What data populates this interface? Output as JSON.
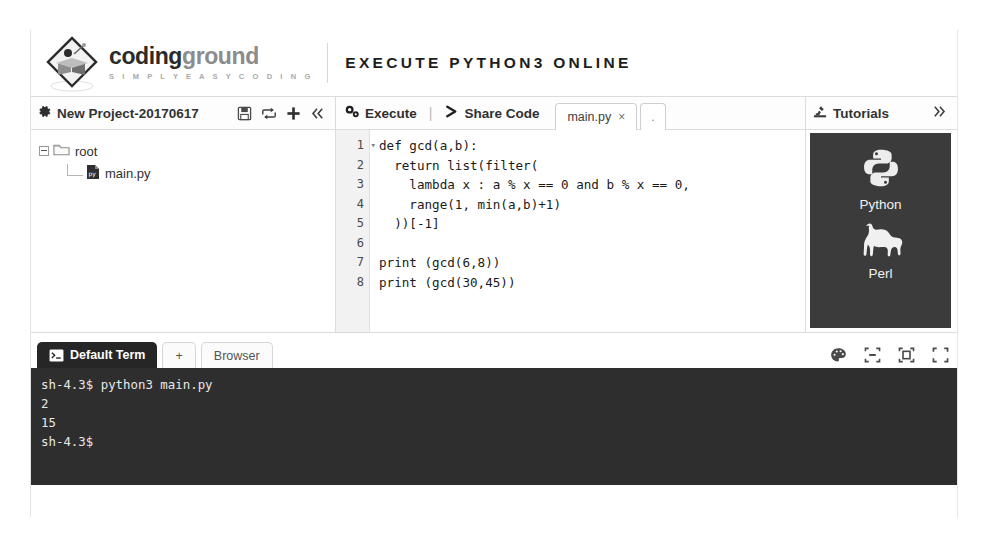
{
  "header": {
    "logo_icon": "codingground-diamond-book-logo",
    "brand_part1": "coding",
    "brand_part2": "ground",
    "brand_tagline": "S I M P L Y E A S Y C O D I N G",
    "page_title": "EXECUTE PYTHON3 ONLINE"
  },
  "project_panel": {
    "gear_icon": "gear-icon",
    "title": "New Project-20170617",
    "icons": [
      {
        "name": "save-icon",
        "glyph": "save"
      },
      {
        "name": "share-project-icon",
        "glyph": "share"
      },
      {
        "name": "add-file-icon",
        "glyph": "plus"
      },
      {
        "name": "collapse-icon",
        "glyph": "«"
      }
    ],
    "tree": {
      "root_label": "root",
      "root_icon": "folder-icon",
      "file_label": "main.py",
      "file_icon": "python-file-icon"
    }
  },
  "editor_panel": {
    "execute_label": "Execute",
    "execute_icon": "gear-icon",
    "separator": "|",
    "share_label": "Share Code",
    "share_icon": "chevron-right-icon",
    "tabs": [
      {
        "label": "main.py",
        "close": "×",
        "active": true
      },
      {
        "label": ".",
        "active": false
      }
    ],
    "line_numbers": [
      "1",
      "2",
      "3",
      "4",
      "5",
      "6",
      "7",
      "8"
    ],
    "fold_marker": "▾",
    "code_lines": [
      "def gcd(a,b):",
      "  return list(filter(",
      "    lambda x : a % x == 0 and b % x == 0,",
      "    range(1, min(a,b)+1)",
      "  ))[-1]",
      "",
      "print (gcd(6,8))",
      "print (gcd(30,45))"
    ]
  },
  "tutorials_panel": {
    "title": "Tutorials",
    "title_icon": "microscope-icon",
    "expand_icon": "»",
    "items": [
      {
        "name": "Python",
        "icon": "python-logo-icon"
      },
      {
        "name": "Perl",
        "icon": "camel-icon"
      }
    ]
  },
  "terminal_panel": {
    "tabs": [
      {
        "label": "Default Term",
        "icon": "console-icon",
        "active": true
      },
      {
        "label": "+",
        "icon": "add-tab-icon",
        "active": false
      },
      {
        "label": "Browser",
        "icon": "browser-icon",
        "active": false
      }
    ],
    "controls": [
      {
        "name": "color-palette-icon"
      },
      {
        "name": "restore-window-icon"
      },
      {
        "name": "maximize-window-icon"
      },
      {
        "name": "fullscreen-icon"
      }
    ],
    "output_lines": [
      "sh-4.3$ python3 main.py",
      "2",
      "15",
      "sh-4.3$"
    ]
  },
  "colors": {
    "terminal_bg": "#2e2e2e",
    "tutorial_bg": "#3b3b3b",
    "panel_border": "#dcdcdc",
    "gutter_bg": "#f2f2f2"
  }
}
